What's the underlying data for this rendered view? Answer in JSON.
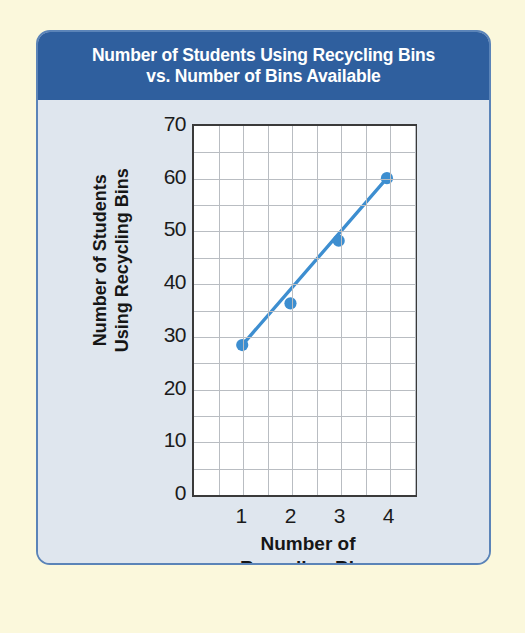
{
  "card": {
    "title_line1": "Number of Students Using Recycling Bins",
    "title_line2": "vs. Number of Bins Available",
    "header_color": "#2f5f9e",
    "border_color": "#5b84b8",
    "panel_color": "#dfe6ee"
  },
  "chart_data": {
    "type": "scatter",
    "title": "Number of Students Using Recycling Bins vs. Number of Bins Available",
    "xlabel_line1": "Number of",
    "xlabel_line2": "Recycling Bins",
    "ylabel_line1": "Number of Students",
    "ylabel_line2": "Using Recycling Bins",
    "x": [
      1,
      2,
      3,
      4
    ],
    "values": [
      28,
      36,
      48,
      60
    ],
    "series": [
      {
        "name": "Students using recycling bins",
        "values": [
          28,
          36,
          48,
          60
        ],
        "marker_color": "#3d8ed0",
        "line_color": "#3d8ed0"
      }
    ],
    "trend_line": {
      "label": "line of best fit",
      "from": [
        1,
        28
      ],
      "to": [
        4,
        60
      ],
      "color": "#3d8ed0"
    },
    "xlim": [
      0,
      4.5
    ],
    "ylim": [
      0,
      70
    ],
    "xticks": [
      "1",
      "2",
      "3",
      "4"
    ],
    "xtick_values": [
      1,
      2,
      3,
      4
    ],
    "yticks": [
      "0",
      "10",
      "20",
      "30",
      "40",
      "50",
      "60",
      "70"
    ],
    "ytick_values": [
      0,
      10,
      20,
      30,
      40,
      50,
      60,
      70
    ],
    "y_minor_step": 5,
    "x_minor_step": 0.5,
    "grid": true,
    "legend": "none",
    "plot_background": "#ffffff",
    "grid_color": "#b9bdc2",
    "axis_color": "#3a3a3a"
  }
}
